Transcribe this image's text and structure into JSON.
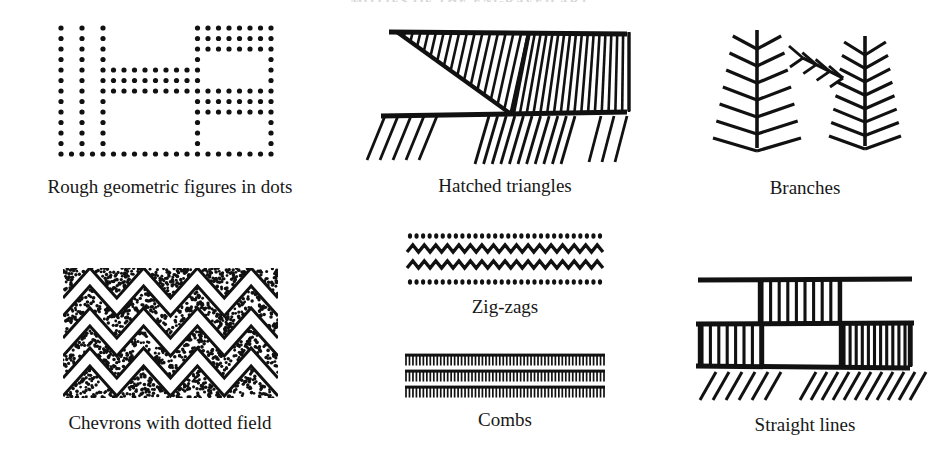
{
  "page": {
    "running_head": "MOTIFS OF THE ENGRAVED ART",
    "background_color": "#ffffff",
    "ink_color": "#111111"
  },
  "panels": [
    {
      "id": "dots",
      "caption": "Rough geometric figures in dots",
      "motif": "rough-geometric-figures-in-dots",
      "description": "Rectilinear enclosures drawn as grids of round dots",
      "row": 1,
      "column": 1
    },
    {
      "id": "hatched",
      "caption": "Hatched triangles",
      "motif": "hatched-triangles",
      "description": "Two opposed triangles filled with parallel hatching above a baseline, with pendant hatching below",
      "row": 1,
      "column": 2
    },
    {
      "id": "branches",
      "caption": "Branches",
      "motif": "branches",
      "description": "Two feather or branch figures with paired oblique barbs on a central stem",
      "row": 1,
      "column": 3
    },
    {
      "id": "chevrons",
      "caption": "Chevrons with dotted field",
      "motif": "chevrons-with-dotted-field",
      "description": "Stacked zig-zag chevron bands separated by stippled dotted fields",
      "row": 2,
      "column": 1
    },
    {
      "id": "zigzags",
      "caption": "Zig-zags",
      "motif": "zig-zags",
      "description": "Two zig-zag lines bordered above and below by rows of dots",
      "row": 2,
      "column": 2
    },
    {
      "id": "combs",
      "caption": "Combs",
      "motif": "combs",
      "description": "Three horizontal bars carrying close-set vertical comb teeth",
      "row": 3,
      "column": 2
    },
    {
      "id": "straight",
      "caption": "Straight lines",
      "motif": "straight-lines",
      "description": "Ladder bands of vertical rungs between horizontal lines with oblique strokes beneath",
      "row": 2,
      "column": 3
    }
  ],
  "motif_geometry": {
    "dots": {
      "dot_radius": 2.6,
      "grid_step": 10.5,
      "rows": 13,
      "columns": 21
    },
    "hatched": {
      "triangle_count": 2,
      "hatch_lines_per_triangle": 17,
      "baseline_count": 2,
      "pendant_groups": 3
    },
    "branches": {
      "figure_count": 2,
      "left_barb_pairs": 7,
      "right_barb_pairs": 8,
      "side_branch_barbs": 4
    },
    "chevrons": {
      "bands": 3,
      "peaks_per_band": 4,
      "stipple_density": "high"
    },
    "zigzags": {
      "zigzag_rows": 2,
      "dot_rows": 2,
      "peaks_per_row": 17
    },
    "combs": {
      "comb_rows": 3,
      "teeth_per_row": 58
    },
    "straight": {
      "ladder_bands": 3,
      "oblique_groups": 2
    }
  }
}
